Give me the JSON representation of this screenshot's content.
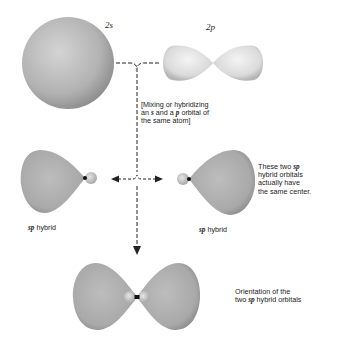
{
  "labels": {
    "s_orbital": "2s",
    "p_orbital": "2p",
    "mixing_note": [
      "[Mixing or hybridizing",
      "an s and a p orbital of",
      "the same atom]"
    ],
    "hybrid_left": "hybrid",
    "hybrid_right": "hybrid",
    "sp": "sp",
    "same_center_note": [
      "These two sp",
      "hybrid orbitals",
      "actually have",
      "the same center."
    ],
    "orientation_note": [
      "Orientation of the",
      "two sp hybrid orbitals"
    ]
  },
  "colors": {
    "orbital_fill": "#b8b8b8",
    "orbital_light": "#e4e4e4",
    "p_orbital_fill": "#d8d8d8",
    "line": "#222222",
    "nucleus": "#111111"
  }
}
